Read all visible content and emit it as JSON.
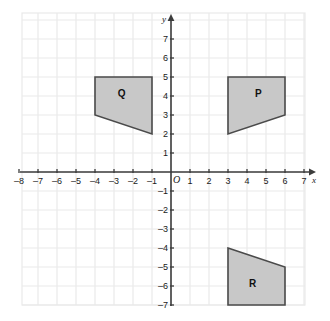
{
  "figure": {
    "title": "",
    "background_color": "#ffffff",
    "grid_color": "#e9e9e9",
    "axis_color": "#3c3c3c",
    "shape_fill": "#c8c8c8",
    "shape_stroke": "#4a4a4a"
  },
  "axes": {
    "x_name": "x",
    "y_name": "y",
    "origin_label": "O",
    "x_min": -8.5,
    "x_max": 7.6,
    "y_min": -7.5,
    "y_max": 7.6,
    "x_ticks": [
      "–8",
      "–7",
      "–6",
      "–5",
      "–4",
      "–3",
      "–2",
      "–1",
      "1",
      "2",
      "3",
      "4",
      "5",
      "6",
      "7"
    ],
    "x_tick_values": [
      -8,
      -7,
      -6,
      -5,
      -4,
      -3,
      -2,
      -1,
      1,
      2,
      3,
      4,
      5,
      6,
      7
    ],
    "y_ticks": [
      "7",
      "6",
      "5",
      "4",
      "3",
      "2",
      "1",
      "–1",
      "–2",
      "–3",
      "–4",
      "–5",
      "–6",
      "–7"
    ],
    "y_tick_values": [
      7,
      6,
      5,
      4,
      3,
      2,
      1,
      -1,
      -2,
      -3,
      -4,
      -5,
      -6,
      -7
    ]
  },
  "chart_data": {
    "type": "scatter",
    "title": "",
    "xlabel": "x",
    "ylabel": "y",
    "xlim": [
      -8.5,
      7.6
    ],
    "ylim": [
      -7.5,
      7.6
    ],
    "grid": true,
    "legend": "none",
    "shapes": [
      {
        "label": "Q",
        "vertices": [
          [
            -4,
            5
          ],
          [
            -1,
            5
          ],
          [
            -1,
            2
          ],
          [
            -4,
            3
          ]
        ],
        "label_position": [
          -2.6,
          4.1
        ],
        "fill": "#c8c8c8",
        "stroke": "#4a4a4a"
      },
      {
        "label": "P",
        "vertices": [
          [
            3,
            5
          ],
          [
            6,
            5
          ],
          [
            6,
            3
          ],
          [
            3,
            2
          ]
        ],
        "label_position": [
          4.6,
          4.1
        ],
        "fill": "#c8c8c8",
        "stroke": "#4a4a4a"
      },
      {
        "label": "R",
        "vertices": [
          [
            3,
            -4
          ],
          [
            6,
            -5
          ],
          [
            6,
            -7
          ],
          [
            3,
            -7
          ]
        ],
        "label_position": [
          4.3,
          -5.9
        ],
        "fill": "#c8c8c8",
        "stroke": "#4a4a4a"
      }
    ]
  }
}
